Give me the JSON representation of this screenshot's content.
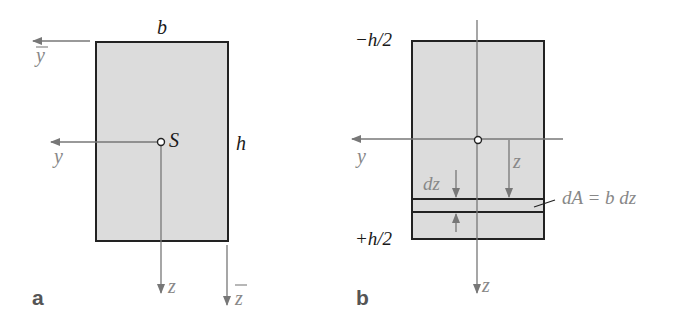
{
  "colors": {
    "fill": "#dcdcdc",
    "outline": "#222222",
    "axis": "#777777",
    "label_dark": "#1a1a1a",
    "label_gray": "#888888"
  },
  "panel_a": {
    "subfigure_label": "a",
    "width_label": "b",
    "height_label": "h",
    "centroid_label": "S",
    "axis_y_label": "y",
    "axis_z_label": "z",
    "axis_ybar_label": "y",
    "axis_zbar_label": "z"
  },
  "panel_b": {
    "subfigure_label": "b",
    "top_label": "−h/2",
    "bottom_label": "+h/2",
    "axis_y_label": "y",
    "axis_z_label": "z",
    "z_dim_label": "z",
    "dz_label": "dz",
    "dA_label": "dA = b dz"
  }
}
